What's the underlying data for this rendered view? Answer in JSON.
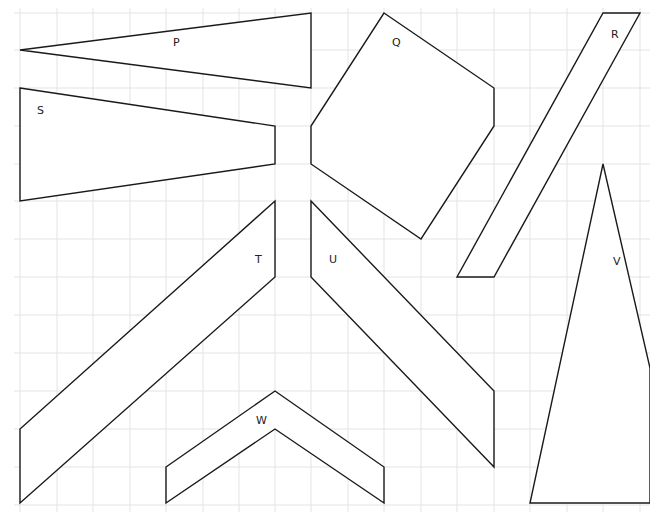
{
  "diagram": {
    "type": "grid-shapes",
    "grid": {
      "x_lines": [
        20,
        57,
        93,
        130,
        166,
        203,
        239,
        275,
        311,
        348,
        384,
        421,
        457,
        494,
        530,
        567,
        603,
        640
      ],
      "y_lines": [
        13,
        50,
        88,
        126,
        164,
        201,
        239,
        277,
        315,
        353,
        391,
        429,
        467,
        505
      ],
      "color": "#e3e3e3"
    },
    "shapes": [
      {
        "id": "P",
        "label": "P",
        "points": "20,50 311,13 311,88",
        "label_pos": [
          173,
          46
        ]
      },
      {
        "id": "Q",
        "label": "Q",
        "points": "384,13 494,88 494,126 421,239 311,164 311,126",
        "label_pos": [
          392,
          46
        ]
      },
      {
        "id": "R",
        "label": "R",
        "points": "603,13 640,13 494,277 457,277",
        "label_pos": [
          611,
          38
        ]
      },
      {
        "id": "S",
        "label": "S",
        "points": "20,88 275,126 275,164 20,201",
        "label_pos": [
          37,
          114
        ]
      },
      {
        "id": "T",
        "label": "T",
        "points": "275,201 275,277 20,503 20,429",
        "label_pos": [
          255,
          263
        ]
      },
      {
        "id": "U",
        "label": "U",
        "points": "311,201 494,391 494,467 311,277",
        "label_pos": [
          329,
          263
        ]
      },
      {
        "id": "V",
        "label": "V",
        "points": "603,164 650,368 650,503 530,503",
        "label_pos": [
          613,
          265
        ]
      },
      {
        "id": "W",
        "label": "W",
        "points": "166,467 275,391 384,467 384,503 275,429 166,503",
        "label_pos": [
          256,
          424
        ]
      }
    ],
    "stroke_color": "#1a1a1a"
  }
}
